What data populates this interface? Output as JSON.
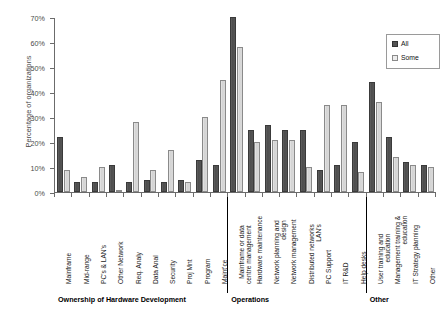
{
  "chart_data": {
    "type": "bar",
    "title": "",
    "xlabel": "",
    "ylabel": "Percentage of organizations",
    "ylim": [
      0,
      70
    ],
    "ytick_labels": [
      "0%",
      "10%",
      "20%",
      "30%",
      "40%",
      "50%",
      "60%",
      "70%"
    ],
    "ytick_values": [
      0,
      10,
      20,
      30,
      40,
      50,
      60,
      70
    ],
    "grid": false,
    "legend_position": "top-right",
    "legend": [
      "All",
      "Some"
    ],
    "colors": {
      "all": "#545454",
      "some": "#ececec"
    },
    "categories": [
      "Mainframe",
      "Mid-range",
      "PC's & LAN's",
      "Other Network",
      "Req. Analy",
      "Data Anal",
      "Security",
      "Proj Mnt",
      "Program",
      "Maint'ce",
      "Mainframe or data\ncentre management",
      "Hardware maintenance",
      "Network planning and\ndesign",
      "Network management",
      "Distributed networks\nLAN's",
      "PC Support",
      "IT R&D",
      "Help desks",
      "User training and\neducation",
      "Management training &\neducation",
      "IT Strategy planning",
      "Other"
    ],
    "series": [
      {
        "name": "All",
        "values": [
          22,
          4,
          4,
          11,
          4,
          5,
          4,
          5,
          13,
          11,
          70,
          25,
          27,
          25,
          25,
          9,
          11,
          20,
          44,
          22,
          12,
          11
        ]
      },
      {
        "name": "Some",
        "values": [
          9,
          6,
          10,
          1,
          28,
          9,
          17,
          4,
          30,
          45,
          58,
          20,
          21,
          21,
          10,
          35,
          35,
          8,
          36,
          14,
          11,
          10
        ]
      }
    ],
    "groups": [
      {
        "label": "Ownership of Hardware Development",
        "start": 0,
        "end": 9
      },
      {
        "label": "Operations",
        "start": 10,
        "end": 17
      },
      {
        "label": "Other",
        "start": 18,
        "end": 21
      }
    ]
  }
}
